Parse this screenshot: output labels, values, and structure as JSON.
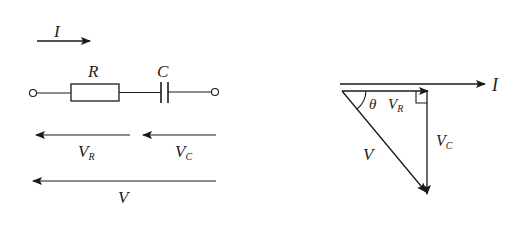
{
  "circuit": {
    "current_label": "I",
    "resistor_label": "R",
    "capacitor_label": "C",
    "vr_label": "V",
    "vr_sub": "R",
    "vc_label": "V",
    "vc_sub": "C",
    "v_label": "V"
  },
  "phasor": {
    "current_label": "I",
    "angle_label": "θ",
    "vr_label": "V",
    "vr_sub": "R",
    "vc_label": "V",
    "vc_sub": "C",
    "v_label": "V"
  },
  "colors": {
    "stroke": "#1a1a1a",
    "background": "#ffffff"
  }
}
